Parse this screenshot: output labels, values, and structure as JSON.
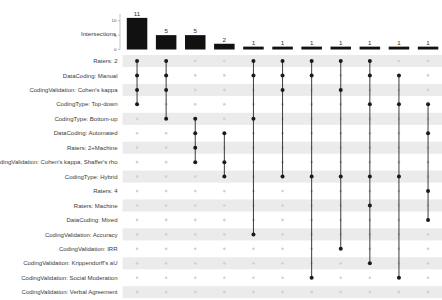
{
  "chart_data": {
    "type": "upset",
    "title": "",
    "ylabel": "Intersections",
    "xlabel": "",
    "ylim": [
      0,
      12
    ],
    "yticks": [
      0,
      5,
      10
    ],
    "ytick_labels": [
      "0",
      "5",
      "10"
    ],
    "grid": false,
    "legend": "none",
    "bar_color": "#111111",
    "dot_on_color": "#1a1a1a",
    "dot_off_color": "#d2d2d2",
    "stripe_color": "#ebebeb",
    "set_labels": [
      "Raters: 2",
      "DataCoding: Manual",
      "CodingValidation: Cohen's kappa",
      "CodingType: Top-down",
      "CodingType: Bottom-up",
      "DataCoding: Automated",
      "Raters: 2+Machine",
      "CodingValidation: Cohen's kappa, Shaffer's rho",
      "CodingType: Hybrid",
      "Raters: 4",
      "Raters: Machine",
      "DataCoding: Mixed",
      "CodingValidation: Accuracy",
      "CodingValidation: IRR",
      "CodingValidation: Krippendorff's aU",
      "CodingValidation: Social Moderation",
      "CodingValidation: Verbal Agreement"
    ],
    "categories": [
      "1",
      "2",
      "3",
      "4",
      "5",
      "6",
      "7",
      "8",
      "9",
      "10",
      "11"
    ],
    "values": [
      11,
      5,
      5,
      2,
      1,
      1,
      1,
      1,
      1,
      1,
      1
    ],
    "intersections": [
      {
        "size": 11,
        "members": [
          0,
          1,
          2,
          3
        ]
      },
      {
        "size": 5,
        "members": [
          0,
          1,
          2,
          4
        ]
      },
      {
        "size": 5,
        "members": [
          4,
          5,
          6,
          7
        ]
      },
      {
        "size": 2,
        "members": [
          5,
          7,
          8
        ]
      },
      {
        "size": 1,
        "members": [
          0,
          1,
          4,
          12
        ]
      },
      {
        "size": 1,
        "members": [
          0,
          1,
          2,
          8
        ]
      },
      {
        "size": 1,
        "members": [
          0,
          1,
          8,
          15
        ]
      },
      {
        "size": 1,
        "members": [
          0,
          2,
          8,
          13
        ]
      },
      {
        "size": 1,
        "members": [
          0,
          1,
          3,
          8,
          10,
          14
        ]
      },
      {
        "size": 1,
        "members": [
          1,
          3,
          8,
          15
        ]
      },
      {
        "size": 1,
        "members": [
          3,
          5,
          9,
          11
        ]
      }
    ]
  }
}
